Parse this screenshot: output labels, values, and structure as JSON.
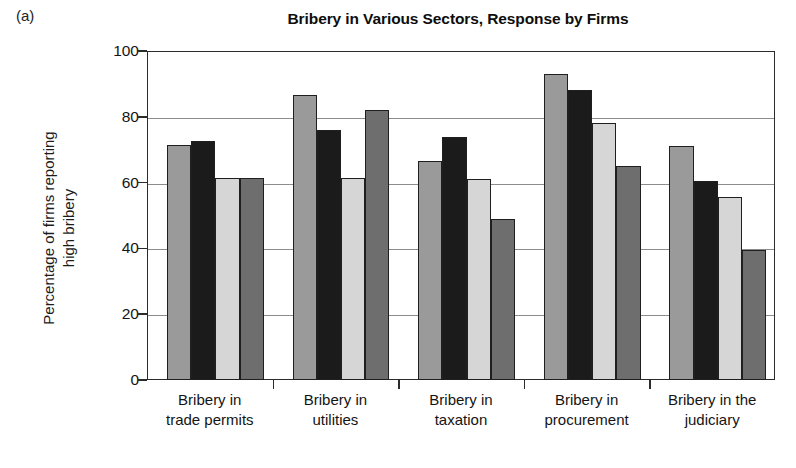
{
  "panel_letter": "(a)",
  "chart_data": {
    "type": "bar",
    "title": "Bribery in Various Sectors, Response by Firms",
    "xlabel": "",
    "ylabel_line1": "Percentage of firms reporting",
    "ylabel_line2": "high bribery",
    "ylim": [
      0,
      100
    ],
    "yticks": [
      0,
      20,
      40,
      60,
      80,
      100
    ],
    "ytick_labels": [
      "0",
      "20",
      "40",
      "60",
      "80",
      "100"
    ],
    "grid": true,
    "legend": "none",
    "categories": [
      "Bribery in trade permits",
      "Bribery in utilities",
      "Bribery in taxation",
      "Bribery in procurement",
      "Bribery in the judiciary"
    ],
    "category_label_lines": [
      [
        "Bribery in",
        "trade permits"
      ],
      [
        "Bribery in",
        "utilities"
      ],
      [
        "Bribery in",
        "taxation"
      ],
      [
        "Bribery in",
        "procurement"
      ],
      [
        "Bribery in the",
        "judiciary"
      ]
    ],
    "series": [
      {
        "name": "series-1",
        "color": "#9a9a9a",
        "values": [
          71.5,
          86.5,
          66.5,
          93.0,
          71.0
        ]
      },
      {
        "name": "series-2",
        "color": "#1b1b1b",
        "values": [
          72.5,
          76.0,
          74.0,
          88.0,
          60.5
        ]
      },
      {
        "name": "series-3",
        "color": "#d6d6d6",
        "values": [
          61.5,
          61.5,
          61.0,
          78.0,
          55.5
        ]
      },
      {
        "name": "series-4",
        "color": "#6e6e6e",
        "values": [
          61.5,
          82.0,
          49.0,
          65.0,
          39.5
        ]
      }
    ]
  }
}
